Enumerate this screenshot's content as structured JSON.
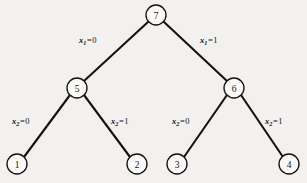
{
  "figure": {
    "name": "binary-decision-tree",
    "background_color": "#f2f1ef",
    "line_color": "#15130f",
    "node_fill": "#fbfaf8",
    "width": 307,
    "height": 183
  },
  "nodes": [
    {
      "id": "n7",
      "label": "7",
      "cx": 156,
      "cy": 15,
      "r": 10,
      "level": 0
    },
    {
      "id": "n5",
      "label": "5",
      "cx": 77,
      "cy": 88,
      "r": 10,
      "level": 1
    },
    {
      "id": "n6",
      "label": "6",
      "cx": 234,
      "cy": 88,
      "r": 10,
      "level": 1
    },
    {
      "id": "n1",
      "label": "1",
      "cx": 17,
      "cy": 164,
      "r": 10,
      "level": 2
    },
    {
      "id": "n2",
      "label": "2",
      "cx": 137,
      "cy": 164,
      "r": 10,
      "level": 2
    },
    {
      "id": "n3",
      "label": "3",
      "cx": 177,
      "cy": 164,
      "r": 10,
      "level": 2
    },
    {
      "id": "n4",
      "label": "4",
      "cx": 289,
      "cy": 164,
      "r": 10,
      "level": 2
    }
  ],
  "edges": [
    {
      "id": "e7-5",
      "from": "n7",
      "to": "n5",
      "x1": 148,
      "y1": 22,
      "x2": 84,
      "y2": 81
    },
    {
      "id": "e7-6",
      "from": "n7",
      "to": "n6",
      "x1": 164,
      "y1": 22,
      "x2": 227,
      "y2": 81
    },
    {
      "id": "e5-1",
      "from": "n5",
      "to": "n1",
      "x1": 70,
      "y1": 95,
      "x2": 24,
      "y2": 157
    },
    {
      "id": "e5-2",
      "from": "n5",
      "to": "n2",
      "x1": 84,
      "y1": 95,
      "x2": 130,
      "y2": 157
    },
    {
      "id": "e6-3",
      "from": "n6",
      "to": "n3",
      "x1": 227,
      "y1": 95,
      "x2": 184,
      "y2": 157
    },
    {
      "id": "e6-4",
      "from": "n6",
      "to": "n4",
      "x1": 241,
      "y1": 95,
      "x2": 283,
      "y2": 157
    }
  ],
  "edge_labels": [
    {
      "id": "lbl-x1-0",
      "edge": "e7-5",
      "variable": "x",
      "subscript": "1",
      "equals": "=",
      "value": "0",
      "left": 79,
      "top": 36
    },
    {
      "id": "lbl-x1-1",
      "edge": "e7-6",
      "variable": "x",
      "subscript": "1",
      "equals": "=",
      "value": "1",
      "left": 200,
      "top": 36
    },
    {
      "id": "lbl-x2-0-left",
      "edge": "e5-1",
      "variable": "x",
      "subscript": "2",
      "equals": "=",
      "value": "0",
      "left": 12,
      "top": 117
    },
    {
      "id": "lbl-x2-1-left",
      "edge": "e5-2",
      "variable": "x",
      "subscript": "2",
      "equals": "=",
      "value": "1",
      "left": 111,
      "top": 117
    },
    {
      "id": "lbl-x2-0-right",
      "edge": "e6-3",
      "variable": "x",
      "subscript": "2",
      "equals": "=",
      "value": "0",
      "left": 172,
      "top": 117
    },
    {
      "id": "lbl-x2-1-right",
      "edge": "e6-4",
      "variable": "x",
      "subscript": "2",
      "equals": "=",
      "value": "1",
      "left": 265,
      "top": 117
    }
  ]
}
